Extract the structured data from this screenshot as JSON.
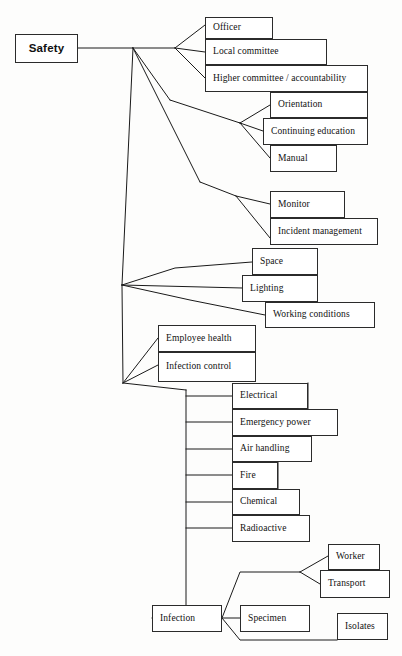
{
  "diagram": {
    "title": "Safety",
    "type": "hierarchical-tree",
    "style": {
      "box_border_color": "#2b2b2b",
      "box_fill": "#ffffff",
      "line_color": "#1a1a1a",
      "background": "#fdfdfc"
    },
    "root": {
      "label": "Safety",
      "x": 15,
      "y": 34,
      "w": 63,
      "h": 29
    },
    "nodes": [
      {
        "key": "officer",
        "label": "Officer",
        "x": 205,
        "y": 17,
        "w": 68,
        "h": 22
      },
      {
        "key": "local_committee",
        "label": "Local committee",
        "x": 205,
        "y": 39,
        "w": 122,
        "h": 26
      },
      {
        "key": "higher_committee",
        "label": "Higher committee / accountability",
        "x": 205,
        "y": 65,
        "w": 163,
        "h": 27
      },
      {
        "key": "orientation",
        "label": "Orientation",
        "x": 270,
        "y": 92,
        "w": 98,
        "h": 26
      },
      {
        "key": "continuing_education",
        "label": "Continuing education",
        "x": 263,
        "y": 118,
        "w": 105,
        "h": 27
      },
      {
        "key": "manual",
        "label": "Manual",
        "x": 270,
        "y": 145,
        "w": 67,
        "h": 27
      },
      {
        "key": "monitor",
        "label": "Monitor",
        "x": 270,
        "y": 191,
        "w": 75,
        "h": 27
      },
      {
        "key": "incident_management",
        "label": "Incident management",
        "x": 270,
        "y": 218,
        "w": 108,
        "h": 27
      },
      {
        "key": "space",
        "label": "Space",
        "x": 252,
        "y": 248,
        "w": 66,
        "h": 27
      },
      {
        "key": "lighting",
        "label": "Lighting",
        "x": 242,
        "y": 275,
        "w": 76,
        "h": 27
      },
      {
        "key": "working_conditions",
        "label": "Working conditions",
        "x": 265,
        "y": 302,
        "w": 110,
        "h": 26
      },
      {
        "key": "employee_health",
        "label": "Employee health",
        "x": 158,
        "y": 325,
        "w": 98,
        "h": 27
      },
      {
        "key": "infection_control",
        "label": "Infection control",
        "x": 158,
        "y": 352,
        "w": 98,
        "h": 30
      },
      {
        "key": "electrical",
        "label": "Electrical",
        "x": 232,
        "y": 383,
        "w": 76,
        "h": 26
      },
      {
        "key": "emergency_power",
        "label": "Emergency power",
        "x": 232,
        "y": 409,
        "w": 106,
        "h": 27
      },
      {
        "key": "air_handling",
        "label": "Air handling",
        "x": 232,
        "y": 436,
        "w": 80,
        "h": 26
      },
      {
        "key": "fire",
        "label": "Fire",
        "x": 232,
        "y": 462,
        "w": 46,
        "h": 27
      },
      {
        "key": "chemical",
        "label": "Chemical",
        "x": 232,
        "y": 489,
        "w": 68,
        "h": 26
      },
      {
        "key": "radioactive",
        "label": "Radioactive",
        "x": 232,
        "y": 515,
        "w": 78,
        "h": 27
      },
      {
        "key": "worker",
        "label": "Worker",
        "x": 328,
        "y": 544,
        "w": 52,
        "h": 26
      },
      {
        "key": "transport",
        "label": "Transport",
        "x": 320,
        "y": 570,
        "w": 70,
        "h": 28
      },
      {
        "key": "infection",
        "label": "Infection",
        "x": 152,
        "y": 605,
        "w": 70,
        "h": 27
      },
      {
        "key": "specimen",
        "label": "Specimen",
        "x": 240,
        "y": 605,
        "w": 70,
        "h": 27
      },
      {
        "key": "isolates",
        "label": "Isolates",
        "x": 337,
        "y": 613,
        "w": 51,
        "h": 27
      }
    ],
    "connectors": [
      {
        "name": "root-trunk",
        "points": "78,48 133,48"
      },
      {
        "name": "trunk-to-committee-fan",
        "points": "133,48 175,48"
      },
      {
        "name": "fan-committee-officer",
        "points": "175,48 205,25"
      },
      {
        "name": "fan-committee-local",
        "points": "175,48 205,52"
      },
      {
        "name": "fan-committee-higher",
        "points": "175,48 205,78"
      },
      {
        "name": "trunk-to-education-branch",
        "points": "133,48 170,100"
      },
      {
        "name": "education-branch-run",
        "points": "170,100 240,123"
      },
      {
        "name": "fan-education-orientation",
        "points": "240,123 270,105"
      },
      {
        "name": "fan-education-continuing",
        "points": "240,123 263,131"
      },
      {
        "name": "fan-education-manual",
        "points": "240,123 270,158"
      },
      {
        "name": "trunk-to-monitor-branch",
        "points": "133,48 200,182"
      },
      {
        "name": "monitor-branch-run",
        "points": "200,182 236,196"
      },
      {
        "name": "fan-monitor-monitor",
        "points": "236,196 270,204"
      },
      {
        "name": "fan-monitor-incident",
        "points": "236,196 270,238"
      },
      {
        "name": "trunk-vertical-main",
        "points": "133,48 122,285"
      },
      {
        "name": "fan-env-space",
        "points": "122,285 175,268 252,262"
      },
      {
        "name": "fan-env-lighting",
        "points": "122,285 242,288"
      },
      {
        "name": "fan-env-working",
        "points": "122,285 190,300 265,315"
      },
      {
        "name": "trunk-lower-vertical",
        "points": "122,285 123,383"
      },
      {
        "name": "fan-health-employee",
        "points": "123,383 158,338"
      },
      {
        "name": "fan-health-infection-ctl",
        "points": "123,383 158,365"
      },
      {
        "name": "fan-health-to-spine",
        "points": "123,383 186,390"
      },
      {
        "name": "spine-utilities-vertical",
        "points": "186,390 186,618"
      },
      {
        "name": "stub-electrical",
        "points": "186,396 232,396"
      },
      {
        "name": "stub-emergency-power",
        "points": "186,422 232,422"
      },
      {
        "name": "stub-air-handling",
        "points": "186,449 232,449"
      },
      {
        "name": "stub-fire",
        "points": "186,475 232,475"
      },
      {
        "name": "stub-chemical",
        "points": "186,502 232,502"
      },
      {
        "name": "stub-radioactive",
        "points": "186,528 232,528"
      },
      {
        "name": "spine-to-infection",
        "points": "186,618 152,618"
      },
      {
        "name": "infection-to-worker-branch",
        "points": "222,618 240,572 300,572"
      },
      {
        "name": "fan-worker",
        "points": "300,572 328,556"
      },
      {
        "name": "fan-transport",
        "points": "300,572 320,584"
      },
      {
        "name": "infection-to-specimen",
        "points": "222,618 240,618"
      },
      {
        "name": "infection-to-isolates",
        "points": "222,618 240,640 337,640"
      },
      {
        "name": "box-edge-electrical-right",
        "points": "308,383 308,409"
      },
      {
        "name": "box-edge-airhandling-fire",
        "points": "278,462 278,489"
      }
    ]
  }
}
